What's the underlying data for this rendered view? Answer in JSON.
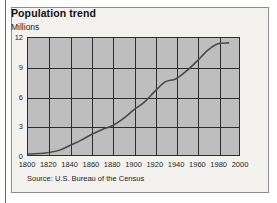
{
  "figure": {
    "title": "Population trend",
    "source": "Source: U.S. Bureau of the Census"
  },
  "chart_data": {
    "type": "line",
    "title": "Population trend",
    "subtitle": "",
    "xlabel": "",
    "ylabel": "Millions",
    "xlim": [
      1800,
      2000
    ],
    "ylim": [
      0,
      12
    ],
    "xticks": [
      1800,
      1820,
      1840,
      1860,
      1880,
      1900,
      1920,
      1940,
      1960,
      1980,
      2000
    ],
    "yticks": [
      0,
      3,
      6,
      9,
      12
    ],
    "grid": true,
    "legend": false,
    "legend_position": "none",
    "annotations": [
      "Source: U.S. Bureau of the Census"
    ],
    "line_color": "#4a4a4a",
    "plot_background": "#bebebe",
    "series": [
      {
        "name": "Population",
        "x": [
          1800,
          1810,
          1820,
          1830,
          1840,
          1850,
          1860,
          1870,
          1880,
          1890,
          1900,
          1910,
          1920,
          1930,
          1940,
          1950,
          1960,
          1970,
          1980,
          1990
        ],
        "values": [
          0.1,
          0.15,
          0.25,
          0.5,
          1.0,
          1.5,
          2.1,
          2.6,
          3.0,
          3.7,
          4.6,
          5.4,
          6.5,
          7.5,
          7.8,
          8.6,
          9.6,
          10.7,
          11.4,
          11.5
        ]
      }
    ]
  }
}
